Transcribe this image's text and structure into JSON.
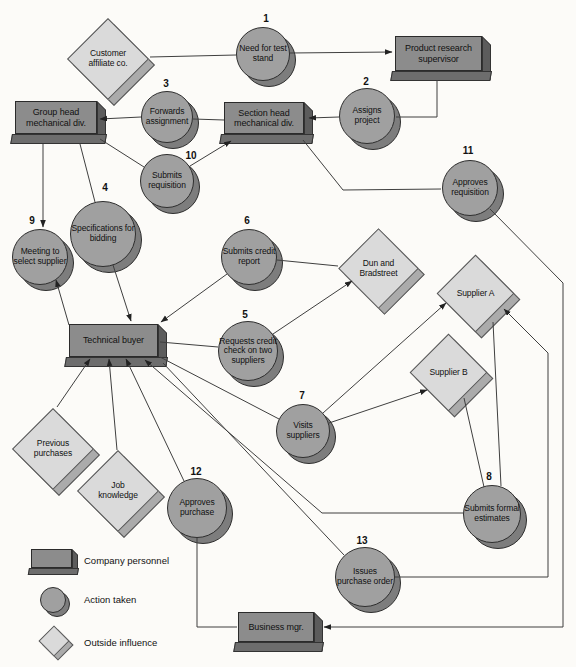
{
  "colors": {
    "personnel_fill": "#8c8c8c",
    "personnel_side": "#5c5c5c",
    "action_fill": "#a0a0a0",
    "action_shadow": "#7d7d7d",
    "influence_fill": "#dadada",
    "influence_shadow": "#ababab",
    "line": "#3f3f3f",
    "background": "#fcfbf8"
  },
  "personnel": [
    {
      "id": "product-research-supervisor",
      "label": "Product research supervisor"
    },
    {
      "id": "group-head-mechanical-div",
      "label": "Group head mechanical div."
    },
    {
      "id": "section-head-mechanical-div",
      "label": "Section head mechanical div."
    },
    {
      "id": "technical-buyer",
      "label": "Technical buyer"
    },
    {
      "id": "business-mgr",
      "label": "Business mgr."
    }
  ],
  "actions": [
    {
      "num": "1",
      "label": "Need for test stand"
    },
    {
      "num": "2",
      "label": "Assigns project"
    },
    {
      "num": "3",
      "label": "Forwards assignment"
    },
    {
      "num": "4",
      "label": "Specifications for bidding"
    },
    {
      "num": "5",
      "label": "Requests credit check on two suppliers"
    },
    {
      "num": "6",
      "label": "Submits credit report"
    },
    {
      "num": "7",
      "label": "Visits suppliers"
    },
    {
      "num": "8",
      "label": "Submits formal estimates"
    },
    {
      "num": "9",
      "label": "Meeting to select supplier"
    },
    {
      "num": "10",
      "label": "Submits requisition"
    },
    {
      "num": "11",
      "label": "Approves requisition"
    },
    {
      "num": "12",
      "label": "Approves purchase"
    },
    {
      "num": "13",
      "label": "Issues purchase order"
    }
  ],
  "influences": [
    {
      "label": "Customer affiliate co."
    },
    {
      "label": "Dun and Bradstreet"
    },
    {
      "label": "Supplier A"
    },
    {
      "label": "Supplier B"
    },
    {
      "label": "Previous purchases"
    },
    {
      "label": "Job knowledge"
    }
  ],
  "legend": {
    "items": [
      {
        "shape": "box",
        "label": "Company personnel"
      },
      {
        "shape": "circle",
        "label": "Action taken"
      },
      {
        "shape": "diamond",
        "label": "Outside influence"
      }
    ]
  },
  "edges": [
    {
      "from": "Customer affiliate co.",
      "to": "1 Need for test stand",
      "arrow": false
    },
    {
      "from": "1 Need for test stand",
      "to": "Product research supervisor",
      "arrow": true
    },
    {
      "from": "Product research supervisor",
      "to": "2 Assigns project",
      "arrow": false
    },
    {
      "from": "2 Assigns project",
      "to": "Section head mechanical div.",
      "arrow": true
    },
    {
      "from": "Section head mechanical div.",
      "to": "3 Forwards assignment",
      "arrow": false
    },
    {
      "from": "3 Forwards assignment",
      "to": "Group head mechanical div.",
      "arrow": true
    },
    {
      "from": "Group head mechanical div.",
      "to": "9 Meeting to select supplier",
      "arrow": true
    },
    {
      "from": "Group head mechanical div.",
      "to": "4 Specifications for bidding",
      "arrow": false
    },
    {
      "from": "4 Specifications for bidding",
      "to": "Technical buyer",
      "arrow": true
    },
    {
      "from": "Group head mechanical div.",
      "to": "10 Submits requisition",
      "arrow": false
    },
    {
      "from": "10 Submits requisition",
      "to": "Section head mechanical div.",
      "arrow": true
    },
    {
      "from": "Section head mechanical div.",
      "to": "11 Approves requisition",
      "arrow": false
    },
    {
      "from": "11 Approves requisition",
      "to": "Business mgr.",
      "arrow": true
    },
    {
      "from": "Technical buyer",
      "to": "5 Requests credit check on two suppliers",
      "arrow": false
    },
    {
      "from": "5 Requests credit check on two suppliers",
      "to": "Dun and Bradstreet",
      "arrow": true
    },
    {
      "from": "Dun and Bradstreet",
      "to": "6 Submits credit report",
      "arrow": false
    },
    {
      "from": "6 Submits credit report",
      "to": "Technical buyer",
      "arrow": true
    },
    {
      "from": "Technical buyer",
      "to": "9 Meeting to select supplier",
      "arrow": true
    },
    {
      "from": "Previous purchases",
      "to": "Technical buyer",
      "arrow": true
    },
    {
      "from": "Job knowledge",
      "to": "Technical buyer",
      "arrow": true
    },
    {
      "from": "12 Approves purchase",
      "to": "Technical buyer",
      "arrow": true
    },
    {
      "from": "8 Submits formal estimates",
      "to": "Technical buyer",
      "arrow": true
    },
    {
      "from": "Technical buyer",
      "to": "7 Visits suppliers",
      "arrow": false
    },
    {
      "from": "Technical buyer",
      "to": "13 Issues purchase order",
      "arrow": false
    },
    {
      "from": "7 Visits suppliers",
      "to": "Supplier A",
      "arrow": true
    },
    {
      "from": "7 Visits suppliers",
      "to": "Supplier B",
      "arrow": true
    },
    {
      "from": "Supplier A",
      "to": "8 Submits formal estimates",
      "arrow": false
    },
    {
      "from": "Supplier B",
      "to": "8 Submits formal estimates",
      "arrow": false
    },
    {
      "from": "13 Issues purchase order",
      "to": "Supplier A",
      "arrow": true
    },
    {
      "from": "Business mgr.",
      "to": "12 Approves purchase",
      "arrow": false
    }
  ]
}
